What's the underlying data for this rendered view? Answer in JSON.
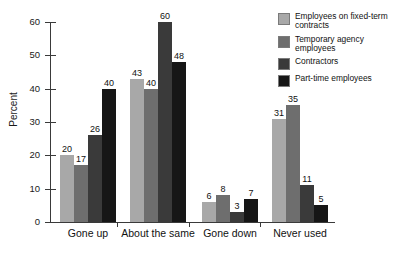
{
  "chart_data": {
    "type": "bar",
    "title": "",
    "xlabel": "",
    "ylabel": "Percent",
    "ylim": [
      0,
      60
    ],
    "yticks": [
      0,
      10,
      20,
      30,
      40,
      50,
      60
    ],
    "ytick_labels": [
      "0",
      "10",
      "20",
      "30",
      "40",
      "50",
      "60"
    ],
    "grid": false,
    "legend_position": "top-right",
    "categories": [
      "Gone up",
      "About the same",
      "Gone down",
      "Never used"
    ],
    "series": [
      {
        "name": "Employees on fixed-term contracts",
        "color": "#a8a8a8",
        "values": [
          20,
          43,
          6,
          31
        ],
        "labels": [
          "20",
          "43",
          "6",
          "31"
        ]
      },
      {
        "name": "Temporary agency employees",
        "color": "#6e6e6e",
        "values": [
          17,
          40,
          8,
          35
        ],
        "labels": [
          "17",
          "40",
          "8",
          "35"
        ]
      },
      {
        "name": "Contractors",
        "color": "#3a3a3a",
        "values": [
          26,
          60,
          3,
          11
        ],
        "labels": [
          "26",
          "60",
          "3",
          "11"
        ]
      },
      {
        "name": "Part-time employees",
        "color": "#161616",
        "values": [
          40,
          48,
          7,
          5
        ],
        "labels": [
          "40",
          "48",
          "7",
          "5"
        ]
      }
    ]
  },
  "legend": {
    "items": [
      {
        "label": "Employees on fixed-term contracts",
        "color": "#a8a8a8"
      },
      {
        "label": "Temporary agency employees",
        "color": "#6e6e6e"
      },
      {
        "label": "Contractors",
        "color": "#3a3a3a"
      },
      {
        "label": "Part-time employees",
        "color": "#161616"
      }
    ]
  },
  "axis": {
    "y_title": "Percent"
  }
}
